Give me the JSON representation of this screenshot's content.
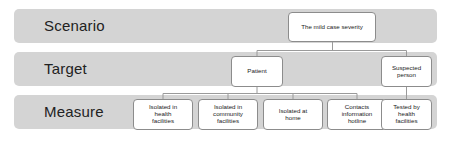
{
  "diagram": {
    "type": "hierarchy-tree",
    "rows": [
      {
        "id": "scenario",
        "label": "Scenario"
      },
      {
        "id": "target",
        "label": "Target"
      },
      {
        "id": "measure",
        "label": "Measure"
      }
    ],
    "colors": {
      "band": "#d4d4d4",
      "node_fill": "#ffffff",
      "node_border": "#8c8c8c",
      "connector": "#9a9a9a",
      "background": "#ffffff",
      "text": "#1a1a1a"
    },
    "nodes": {
      "scenario": [
        {
          "id": "mild-case-severity",
          "label": "The mild case severity"
        }
      ],
      "target": [
        {
          "id": "patient",
          "label": "Patient"
        },
        {
          "id": "suspected-person",
          "label": "Suspected\nperson"
        }
      ],
      "measure": [
        {
          "id": "isolated-health-facilities",
          "label": "Isolated in\nhealth\nfacilities"
        },
        {
          "id": "isolated-community-facilities",
          "label": "Isolated in\ncommunity\nfacilities"
        },
        {
          "id": "isolated-at-home",
          "label": "Isolated at\nhome"
        },
        {
          "id": "contacts-information-hotline",
          "label": "Contacts\ninformation\nhotline"
        },
        {
          "id": "tested-by-health-facilities",
          "label": "Tested by\nhealth\nfacilities"
        }
      ]
    },
    "edges": [
      {
        "from": "mild-case-severity",
        "to": "patient"
      },
      {
        "from": "mild-case-severity",
        "to": "suspected-person"
      },
      {
        "from": "patient",
        "to": "isolated-health-facilities"
      },
      {
        "from": "patient",
        "to": "isolated-community-facilities"
      },
      {
        "from": "patient",
        "to": "isolated-at-home"
      },
      {
        "from": "patient",
        "to": "contacts-information-hotline"
      },
      {
        "from": "suspected-person",
        "to": "tested-by-health-facilities"
      }
    ]
  }
}
